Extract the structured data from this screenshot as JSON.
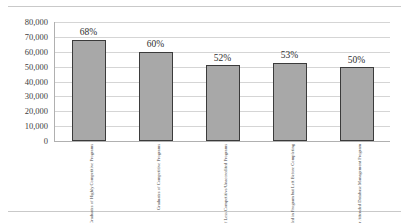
{
  "chart_data": {
    "type": "bar",
    "title": "",
    "xlabel": "",
    "ylabel": "",
    "ylim": [
      0,
      80000
    ],
    "ytick_values": [
      80000,
      70000,
      60000,
      50000,
      40000,
      30000,
      20000,
      10000,
      0
    ],
    "ytick_labels": [
      "80,000",
      "70,000",
      "60,000",
      "50,000",
      "40,000",
      "30,000",
      "20,000",
      "10,000",
      "0"
    ],
    "grid": true,
    "legend": "none",
    "bar_color": "#a8a8a8",
    "bar_edge_color": "#3b3b3b",
    "categories": [
      "Graduates of Highly Competitive Programs",
      "Graduates of Competitive Programs",
      "Graduates of Less Competitive/Unaccredited Programs",
      "Non-Graduates Enrolled in Program but Left Before Completing",
      "Non-Graduates that Never Attended Database Management Program"
    ],
    "category_lines": [
      [
        "Graduates of Highly",
        "Competitive Programs"
      ],
      [
        "Graduates of Competitive",
        "Programs"
      ],
      [
        "Graduates of Less",
        "Competitive/Unaccredited",
        "Programs"
      ],
      [
        "Non-Graduates Enrolled",
        "in Program but Left",
        "Before Completing"
      ],
      [
        "Non-Graduates that Never",
        "Attended Database",
        "Management Program"
      ]
    ],
    "values": [
      68000,
      60000,
      51000,
      52500,
      49500
    ],
    "data_labels": [
      "68%",
      "60%",
      "52%",
      "53%",
      "50%"
    ]
  }
}
